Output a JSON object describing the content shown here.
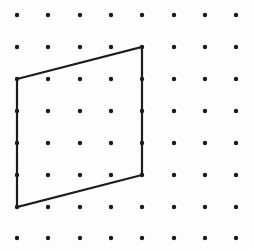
{
  "figure": {
    "background_color": "#fdfdfd",
    "width": 254,
    "height": 250
  },
  "grid": {
    "name": "dot-lattice",
    "columns": 8,
    "rows": 8,
    "origin_x": 17,
    "origin_y": 15,
    "spacing_x": 31.3,
    "spacing_y": 31.9,
    "dot_radius": 2.2,
    "dot_color": "#1a1a1a",
    "column_x": [
      17,
      48,
      80,
      111,
      142,
      174,
      205,
      236
    ],
    "row_y": [
      15,
      47,
      79,
      111,
      143,
      175,
      207,
      238
    ]
  },
  "shape": {
    "name": "parallelogram",
    "type": "polygon",
    "stroke_color": "#1c1c1c",
    "stroke_width": 2.2,
    "fill": "none",
    "vertices_grid": [
      {
        "label": "top-left",
        "col": 0,
        "row": 2
      },
      {
        "label": "top-right",
        "col": 4,
        "row": 1
      },
      {
        "label": "bottom-right",
        "col": 4,
        "row": 5
      },
      {
        "label": "bottom-left",
        "col": 0,
        "row": 6
      }
    ],
    "vertices_px": [
      {
        "label": "top-left",
        "x": 17,
        "y": 79
      },
      {
        "label": "top-right",
        "x": 142,
        "y": 47
      },
      {
        "label": "bottom-right",
        "x": 142,
        "y": 175
      },
      {
        "label": "bottom-left",
        "x": 17,
        "y": 207
      }
    ],
    "points_attr": "17,79 142,47 142,175 17,207"
  }
}
